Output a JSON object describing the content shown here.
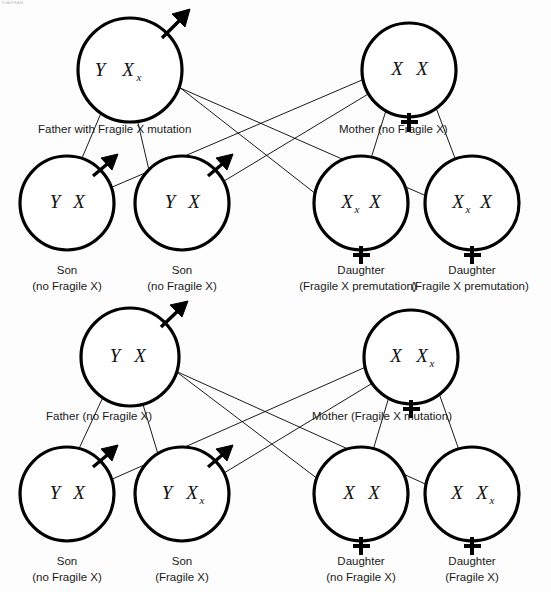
{
  "figure": {
    "masthead": "DIAGRAM",
    "chromosome_symbols": {
      "y": "Y",
      "x": "X",
      "fragile_subscript": "x"
    }
  },
  "panels": [
    {
      "id": "panel-top",
      "name": "father-carrier-cross",
      "parents": [
        {
          "id": "top-father",
          "role": "father",
          "label": "Father with Fragile X mutation",
          "sex_symbol": "male-arrow",
          "genotype": [
            {
              "allele": "Y",
              "fragile": false
            },
            {
              "allele": "X",
              "fragile": true
            }
          ]
        },
        {
          "id": "top-mother",
          "role": "mother",
          "label": "Mother (no Fragile X)",
          "sex_symbol": "female-cross",
          "genotype": [
            {
              "allele": "X",
              "fragile": false
            },
            {
              "allele": "X",
              "fragile": false
            }
          ]
        }
      ],
      "children": [
        {
          "id": "top-child-1",
          "role": "son",
          "caption_line1": "Son",
          "caption_line2": "(no Fragile X)",
          "sex_symbol": "male-arrow",
          "genotype": [
            {
              "allele": "Y",
              "fragile": false
            },
            {
              "allele": "X",
              "fragile": false
            }
          ]
        },
        {
          "id": "top-child-2",
          "role": "son",
          "caption_line1": "Son",
          "caption_line2": "(no Fragile X)",
          "sex_symbol": "male-arrow",
          "genotype": [
            {
              "allele": "Y",
              "fragile": false
            },
            {
              "allele": "X",
              "fragile": false
            }
          ]
        },
        {
          "id": "top-child-3",
          "role": "daughter",
          "caption_line1": "Daughter",
          "caption_line2": "(Fragile X premutation)",
          "sex_symbol": "female-cross",
          "genotype": [
            {
              "allele": "X",
              "fragile": true
            },
            {
              "allele": "X",
              "fragile": false
            }
          ]
        },
        {
          "id": "top-child-4",
          "role": "daughter",
          "caption_line1": "Daughter",
          "caption_line2": "(Fragile X premutation)",
          "sex_symbol": "female-cross",
          "genotype": [
            {
              "allele": "X",
              "fragile": true
            },
            {
              "allele": "X",
              "fragile": false
            }
          ]
        }
      ]
    },
    {
      "id": "panel-bottom",
      "name": "mother-carrier-cross",
      "parents": [
        {
          "id": "bottom-father",
          "role": "father",
          "label": "Father (no Fragile X)",
          "sex_symbol": "male-arrow",
          "genotype": [
            {
              "allele": "Y",
              "fragile": false
            },
            {
              "allele": "X",
              "fragile": false
            }
          ]
        },
        {
          "id": "bottom-mother",
          "role": "mother",
          "label": "Mother (Fragile X mutation)",
          "sex_symbol": "female-cross",
          "genotype": [
            {
              "allele": "X",
              "fragile": false
            },
            {
              "allele": "X",
              "fragile": true
            }
          ]
        }
      ],
      "children": [
        {
          "id": "bottom-child-1",
          "role": "son",
          "caption_line1": "Son",
          "caption_line2": "(no Fragile X)",
          "sex_symbol": "male-arrow",
          "genotype": [
            {
              "allele": "Y",
              "fragile": false
            },
            {
              "allele": "X",
              "fragile": false
            }
          ]
        },
        {
          "id": "bottom-child-2",
          "role": "son",
          "caption_line1": "Son",
          "caption_line2": "(Fragile X)",
          "sex_symbol": "male-arrow",
          "genotype": [
            {
              "allele": "Y",
              "fragile": false
            },
            {
              "allele": "X",
              "fragile": true
            }
          ]
        },
        {
          "id": "bottom-child-3",
          "role": "daughter",
          "caption_line1": "Daughter",
          "caption_line2": "(no Fragile X)",
          "sex_symbol": "female-cross",
          "genotype": [
            {
              "allele": "X",
              "fragile": false
            },
            {
              "allele": "X",
              "fragile": false
            }
          ]
        },
        {
          "id": "bottom-child-4",
          "role": "daughter",
          "caption_line1": "Daughter",
          "caption_line2": "(Fragile X)",
          "sex_symbol": "female-cross",
          "genotype": [
            {
              "allele": "X",
              "fragile": false
            },
            {
              "allele": "X",
              "fragile": true
            }
          ]
        }
      ]
    }
  ]
}
